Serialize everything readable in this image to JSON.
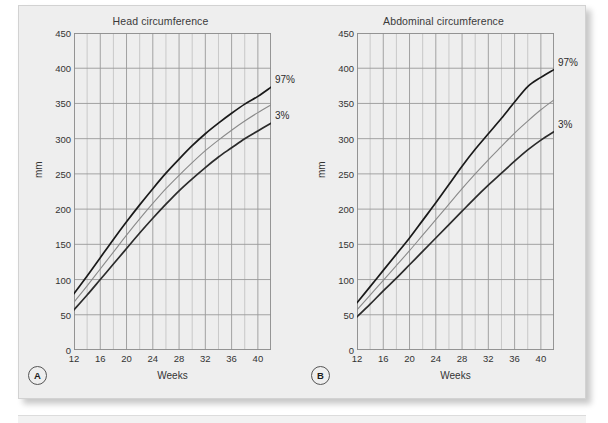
{
  "figure": {
    "background_color": "#eeeeee",
    "panels": [
      {
        "letter": "A",
        "title": "Head circumference",
        "xlabel": "Weeks",
        "ylabel": "mm",
        "annotations": [
          {
            "text": "97%"
          },
          {
            "text": "3%"
          }
        ]
      },
      {
        "letter": "B",
        "title": "Abdominal circumference",
        "xlabel": "Weeks",
        "ylabel": "mm",
        "annotations": [
          {
            "text": "97%"
          },
          {
            "text": "3%"
          }
        ]
      }
    ]
  },
  "chart_data": [
    {
      "type": "line",
      "title": "Head circumference",
      "panel": "A",
      "xlabel": "Weeks",
      "ylabel": "mm",
      "xlim": [
        12,
        42
      ],
      "ylim": [
        0,
        450
      ],
      "xticks": [
        12,
        16,
        20,
        24,
        28,
        32,
        36,
        40
      ],
      "yticks": [
        0,
        50,
        100,
        150,
        200,
        250,
        300,
        350,
        400,
        450
      ],
      "x_minor_step": 2,
      "grid": true,
      "legend": "inline-right",
      "x": [
        12,
        14,
        16,
        18,
        20,
        22,
        24,
        26,
        28,
        30,
        32,
        34,
        36,
        38,
        40,
        42
      ],
      "series": [
        {
          "name": "97%",
          "color": "#1a1a1a",
          "values": [
            80,
            105,
            131,
            157,
            182,
            206,
            229,
            251,
            271,
            290,
            307,
            322,
            336,
            349,
            360,
            373
          ]
        },
        {
          "name": "50%",
          "color": "#8a8a8a",
          "values": [
            68,
            91,
            115,
            139,
            163,
            186,
            208,
            229,
            248,
            266,
            283,
            298,
            312,
            325,
            337,
            348
          ]
        },
        {
          "name": "3%",
          "color": "#2b2b2b",
          "values": [
            57,
            78,
            100,
            122,
            144,
            166,
            187,
            207,
            226,
            243,
            259,
            274,
            287,
            300,
            311,
            322
          ]
        }
      ]
    },
    {
      "type": "line",
      "title": "Abdominal circumference",
      "panel": "B",
      "xlabel": "Weeks",
      "ylabel": "mm",
      "xlim": [
        12,
        42
      ],
      "ylim": [
        0,
        450
      ],
      "xticks": [
        12,
        16,
        20,
        24,
        28,
        32,
        36,
        40
      ],
      "yticks": [
        0,
        50,
        100,
        150,
        200,
        250,
        300,
        350,
        400,
        450
      ],
      "x_minor_step": 2,
      "grid": true,
      "legend": "inline-right",
      "x": [
        12,
        14,
        16,
        18,
        20,
        22,
        24,
        26,
        28,
        30,
        32,
        34,
        36,
        38,
        40,
        42
      ],
      "series": [
        {
          "name": "97%",
          "color": "#1a1a1a",
          "values": [
            67,
            90,
            113,
            136,
            159,
            184,
            209,
            235,
            261,
            285,
            307,
            329,
            352,
            374,
            387,
            398
          ]
        },
        {
          "name": "50%",
          "color": "#8a8a8a",
          "values": [
            57,
            78,
            99,
            120,
            141,
            163,
            185,
            207,
            229,
            250,
            270,
            289,
            308,
            325,
            341,
            355
          ]
        },
        {
          "name": "3%",
          "color": "#2b2b2b",
          "values": [
            47,
            65,
            84,
            102,
            121,
            140,
            159,
            178,
            197,
            216,
            234,
            251,
            268,
            284,
            298,
            310
          ]
        }
      ]
    }
  ]
}
